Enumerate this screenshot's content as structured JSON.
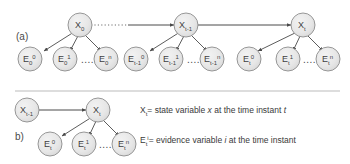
{
  "figure": {
    "background_color": "#ffffff",
    "node_fill": "#e6e6e6",
    "node_stroke": "#8c8c8c",
    "edge_color": "#4a4a4a",
    "divider_color": "#d2d2d2",
    "text_color": "#3a3a3a"
  },
  "panels": [
    {
      "id": "a",
      "label": "(a)",
      "state_nodes": [
        {
          "name": "X0",
          "base": "X",
          "sub": "0",
          "sup": ""
        },
        {
          "name": "Xt-1",
          "base": "X",
          "sub": "t-1",
          "sup": ""
        },
        {
          "name": "Xt",
          "base": "X",
          "sub": "t",
          "sup": ""
        }
      ],
      "evidence_groups": [
        {
          "parent": "X0",
          "ellipsis": "....",
          "nodes": [
            {
              "base": "E",
              "sub": "0",
              "sup": "0"
            },
            {
              "base": "E",
              "sub": "0",
              "sup": "1"
            },
            {
              "base": "E",
              "sub": "0",
              "sup": "n"
            }
          ]
        },
        {
          "parent": "Xt-1",
          "ellipsis": "....",
          "nodes": [
            {
              "base": "E",
              "sub": "t-1",
              "sup": "0"
            },
            {
              "base": "E",
              "sub": "t-1",
              "sup": "1"
            },
            {
              "base": "E",
              "sub": "t-1",
              "sup": "n"
            }
          ]
        },
        {
          "parent": "Xt",
          "ellipsis": "....",
          "nodes": [
            {
              "base": "E",
              "sub": "t",
              "sup": "0"
            },
            {
              "base": "E",
              "sub": "t",
              "sup": "1"
            },
            {
              "base": "E",
              "sub": "t",
              "sup": "n"
            }
          ]
        }
      ],
      "transitions": [
        {
          "from": "X0",
          "to": "Xt-1",
          "style": "dotted-then-solid"
        },
        {
          "from": "Xt-1",
          "to": "Xt",
          "style": "solid"
        }
      ]
    },
    {
      "id": "b",
      "label": "b)",
      "state_nodes": [
        {
          "name": "Xt-1",
          "base": "X",
          "sub": "t-1",
          "sup": ""
        },
        {
          "name": "Xt",
          "base": "X",
          "sub": "t",
          "sup": ""
        }
      ],
      "evidence_groups": [
        {
          "parent": "Xt",
          "ellipsis": "....",
          "nodes": [
            {
              "base": "E",
              "sub": "t",
              "sup": "0"
            },
            {
              "base": "E",
              "sub": "t",
              "sup": "1"
            },
            {
              "base": "E",
              "sub": "t",
              "sup": "n"
            }
          ]
        }
      ],
      "transitions": [
        {
          "from": "Xt-1",
          "to": "Xt",
          "style": "solid"
        }
      ]
    }
  ],
  "legend": {
    "line1": {
      "symbol_base": "X",
      "symbol_sub": "t",
      "symbol_sup": "",
      "eq": "= state variable ",
      "italic1": "x",
      "mid": " at the time instant ",
      "italic2": "t"
    },
    "line2": {
      "symbol_base": "E",
      "symbol_sub": "t",
      "symbol_sup": "i",
      "eq": "= evidence variable ",
      "italic1": "i",
      "mid": " at the time instant",
      "italic2": ""
    }
  }
}
